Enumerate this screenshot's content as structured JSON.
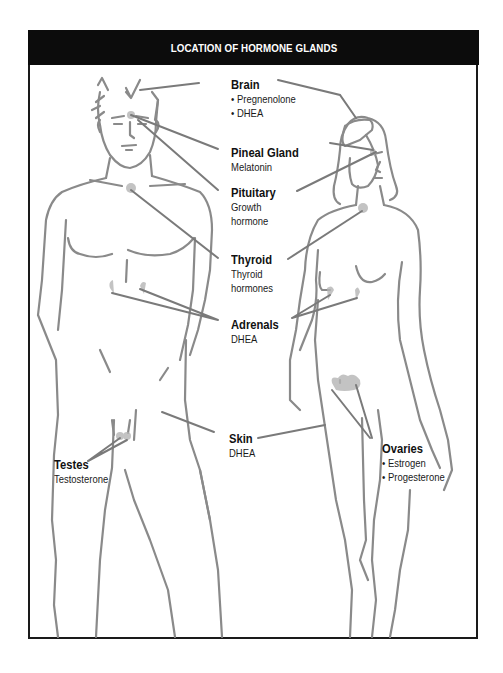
{
  "title": "LOCATION OF HORMONE GLANDS",
  "colors": {
    "header_bg": "#0c0c0c",
    "header_text": "#ffffff",
    "outline": "#8a8a8a",
    "gland_highlight": "#b0b0b0",
    "frame": "#1a1a1a"
  },
  "figures": [
    "male-figure",
    "female-figure"
  ],
  "labels": {
    "brain": {
      "name": "Brain",
      "items": [
        "Pregnenolone",
        "DHEA"
      ]
    },
    "pineal": {
      "name": "Pineal Gland",
      "hormone": "Melatonin"
    },
    "pituitary": {
      "name": "Pituitary",
      "hormone_line1": "Growth",
      "hormone_line2": "hormone"
    },
    "thyroid": {
      "name": "Thyroid",
      "hormone_line1": "Thyroid",
      "hormone_line2": "hormones"
    },
    "adrenals": {
      "name": "Adrenals",
      "hormone": "DHEA"
    },
    "skin": {
      "name": "Skin",
      "hormone": "DHEA"
    },
    "testes": {
      "name": "Testes",
      "hormone": "Testosterone"
    },
    "ovaries": {
      "name": "Ovaries",
      "items": [
        "Estrogen",
        "Progesterone"
      ]
    }
  }
}
